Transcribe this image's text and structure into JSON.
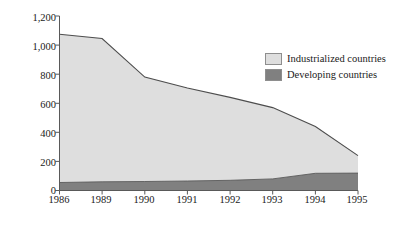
{
  "chart_data": {
    "type": "area",
    "title": "",
    "xlabel": "",
    "ylabel": "CFC production (000 ODP tons)",
    "categories": [
      "1986",
      "1989",
      "1990",
      "1991",
      "1992",
      "1993",
      "1994",
      "1995"
    ],
    "stacked": true,
    "grid": false,
    "legend_position": "top-right",
    "ylim": [
      0,
      1200
    ],
    "yticks": [
      0,
      200,
      400,
      600,
      800,
      1000,
      1200
    ],
    "ytick_labels": [
      "0",
      "200",
      "400",
      "600",
      "800",
      "1,000",
      "1,200"
    ],
    "series": [
      {
        "name": "Developing countries",
        "color": "#808080",
        "values": [
          55,
          60,
          62,
          65,
          70,
          80,
          118,
          120
        ]
      },
      {
        "name": "Industrialized countries",
        "color": "#dedede",
        "values": [
          1020,
          985,
          718,
          640,
          570,
          490,
          322,
          120
        ]
      }
    ],
    "totals": [
      1075,
      1045,
      780,
      705,
      640,
      570,
      440,
      240
    ],
    "legend": [
      {
        "label": "Industrialized countries",
        "color": "#dedede"
      },
      {
        "label": "Developing countries",
        "color": "#808080"
      }
    ]
  }
}
